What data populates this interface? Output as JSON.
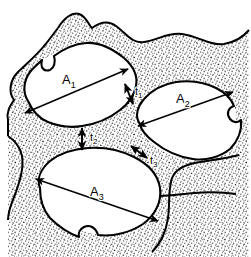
{
  "figure": {
    "type": "microstructure-schematic",
    "background_color": "#ffffff",
    "ink_color": "#000000",
    "matrix_fill": "stipple",
    "particle_fill": "#ffffff"
  },
  "particles": [
    {
      "id": "A1",
      "label": "A",
      "subscript": "1",
      "label_x": 62,
      "label_y": 84,
      "dimension_arrow": {
        "x1": 25,
        "y1": 113,
        "x2": 128,
        "y2": 69,
        "double_headed": true
      }
    },
    {
      "id": "A2",
      "label": "A",
      "subscript": "2",
      "label_x": 176,
      "label_y": 103,
      "dimension_arrow": {
        "x1": 138,
        "y1": 126,
        "x2": 233,
        "y2": 92,
        "double_headed": true
      }
    },
    {
      "id": "A3",
      "label": "A",
      "subscript": "3",
      "label_x": 90,
      "label_y": 196,
      "dimension_arrow": {
        "x1": 36,
        "y1": 179,
        "x2": 158,
        "y2": 221,
        "double_headed": true
      }
    }
  ],
  "necks": [
    {
      "id": "t1",
      "label": "t",
      "subscript": "1",
      "label_x": 135,
      "label_y": 95,
      "between": [
        "A1",
        "A2"
      ],
      "arrow": {
        "x1": 125,
        "y1": 84,
        "x2": 133,
        "y2": 104,
        "double_headed": true
      }
    },
    {
      "id": "t2",
      "label": "t",
      "subscript": "2",
      "label_x": 90,
      "label_y": 141,
      "between": [
        "A1",
        "A3"
      ],
      "arrow": {
        "x1": 82,
        "y1": 128,
        "x2": 82,
        "y2": 150,
        "double_headed": true
      }
    },
    {
      "id": "t3",
      "label": "t",
      "subscript": "3",
      "label_x": 150,
      "label_y": 164,
      "between": [
        "A2",
        "A3"
      ],
      "arrow": {
        "x1": 131,
        "y1": 146,
        "x2": 147,
        "y2": 158,
        "double_headed": true
      }
    }
  ],
  "legend": {
    "area_symbol": "A",
    "thickness_symbol": "t"
  }
}
